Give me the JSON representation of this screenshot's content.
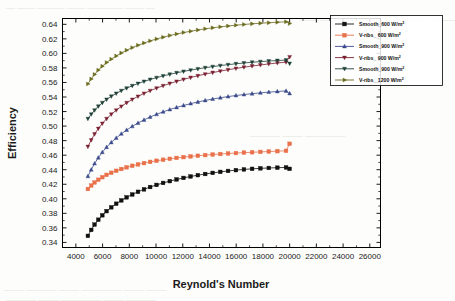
{
  "figure": {
    "background_color": "#fdfdfb",
    "plot_area_border_color": "#000000"
  },
  "ghost_text": [
    {
      "text": "—  ——  ———   ——  ————  ——  —",
      "x": 6,
      "y": 2,
      "size": 9
    },
    {
      "text": "——  ———  ——  ———— —— ———",
      "x": 300,
      "y": 14,
      "size": 9
    },
    {
      "text": "———  ——  ————",
      "x": 250,
      "y": 130,
      "size": 10
    },
    {
      "text": "—— ——— ——  ———— —— ——",
      "x": 4,
      "y": 284,
      "size": 10
    },
    {
      "text": "———  —— ————  ——  ———",
      "x": 6,
      "y": 294,
      "size": 10
    }
  ],
  "chart_data": {
    "type": "line",
    "title": "",
    "xlabel": "Reynold's Number",
    "ylabel": "Efficiency",
    "xlim": [
      3000,
      26800
    ],
    "ylim": [
      0.333,
      0.648
    ],
    "xticks": [
      4000,
      6000,
      8000,
      10000,
      12000,
      14000,
      16000,
      18000,
      20000,
      22000,
      24000,
      26000
    ],
    "xtick_labels": [
      "4000",
      "6000",
      "8000",
      "10000",
      "12000",
      "14000",
      "16000",
      "18000",
      "20000",
      "22000",
      "24000",
      "26000"
    ],
    "yticks": [
      0.34,
      0.36,
      0.38,
      0.4,
      0.42,
      0.44,
      0.46,
      0.48,
      0.5,
      0.52,
      0.54,
      0.56,
      0.58,
      0.6,
      0.62,
      0.64
    ],
    "ytick_labels": [
      "0.34",
      "0.36",
      "0.38",
      "0.40",
      "0.42",
      "0.44",
      "0.46",
      "0.48",
      "0.50",
      "0.52",
      "0.54",
      "0.56",
      "0.58",
      "0.60",
      "0.62",
      "0.64"
    ],
    "grid": false,
    "legend_position": "upper right",
    "x": [
      4900,
      5150,
      5400,
      5680,
      5980,
      6300,
      6650,
      7020,
      7400,
      7800,
      8220,
      8650,
      9100,
      9560,
      10040,
      10530,
      11030,
      11540,
      12060,
      12590,
      13130,
      13680,
      14240,
      14810,
      15390,
      15980,
      16580,
      17190,
      17810,
      18440,
      19080,
      19730,
      20000
    ],
    "series": [
      {
        "name": "Smooth_600 W/m²",
        "label_main": "Smooth_600 W/m",
        "label_sup": "2",
        "color": "#111111",
        "marker": "square",
        "values": [
          0.349,
          0.3572,
          0.3645,
          0.3712,
          0.3773,
          0.383,
          0.3883,
          0.3932,
          0.3978,
          0.402,
          0.4059,
          0.4096,
          0.413,
          0.4162,
          0.4191,
          0.4218,
          0.4243,
          0.4266,
          0.4287,
          0.4307,
          0.4325,
          0.4341,
          0.4356,
          0.437,
          0.4383,
          0.4394,
          0.4404,
          0.4412,
          0.4419,
          0.4424,
          0.4428,
          0.4431,
          0.4412
        ]
      },
      {
        "name": "V-ribs_ 600 W/m²",
        "label_main": "V-ribs_ 600 W/m",
        "label_sup": "2",
        "color": "#e8714a",
        "marker": "square",
        "values": [
          0.4135,
          0.4182,
          0.4224,
          0.4262,
          0.4297,
          0.4329,
          0.4358,
          0.4385,
          0.441,
          0.4433,
          0.4454,
          0.4473,
          0.4491,
          0.4508,
          0.4523,
          0.4537,
          0.455,
          0.4562,
          0.4573,
          0.4583,
          0.4592,
          0.4601,
          0.4609,
          0.4616,
          0.4623,
          0.4629,
          0.4635,
          0.464,
          0.4645,
          0.465,
          0.4655,
          0.466,
          0.4757
        ]
      },
      {
        "name": "Smooth_900 W/m²",
        "label_main": "Smooth_900 W/m",
        "label_sup": "2",
        "color": "#3b4a8c",
        "marker": "triangle-up",
        "values": [
          0.431,
          0.44,
          0.4485,
          0.4565,
          0.464,
          0.471,
          0.4775,
          0.4836,
          0.4893,
          0.4946,
          0.4996,
          0.5042,
          0.5085,
          0.5125,
          0.5162,
          0.5196,
          0.5228,
          0.5257,
          0.5284,
          0.5309,
          0.5332,
          0.5353,
          0.5372,
          0.539,
          0.5406,
          0.5421,
          0.5434,
          0.5446,
          0.5457,
          0.5467,
          0.5476,
          0.5484,
          0.5449
        ]
      },
      {
        "name": "V-ribs_ 900 W/m²",
        "label_main": "V-ribs_ 900 W/m",
        "label_sup": "2",
        "color": "#7a2030",
        "marker": "triangle-down",
        "values": [
          0.4718,
          0.4808,
          0.489,
          0.4966,
          0.5036,
          0.5101,
          0.5162,
          0.5218,
          0.5271,
          0.532,
          0.5366,
          0.5409,
          0.5449,
          0.5487,
          0.5522,
          0.5555,
          0.5586,
          0.5615,
          0.5642,
          0.5668,
          0.5692,
          0.5715,
          0.5736,
          0.5756,
          0.5775,
          0.5793,
          0.581,
          0.5826,
          0.5841,
          0.5855,
          0.5868,
          0.588,
          0.5952
        ]
      },
      {
        "name": "Smooth_900 W/m²",
        "label_main": "Smooth_900 W/m",
        "label_sup": "2",
        "color": "#1f4038",
        "marker": "triangle-down",
        "values": [
          0.5102,
          0.5163,
          0.5219,
          0.5272,
          0.5321,
          0.5367,
          0.541,
          0.545,
          0.5487,
          0.5522,
          0.5555,
          0.5586,
          0.5614,
          0.5641,
          0.5666,
          0.569,
          0.5712,
          0.5733,
          0.5752,
          0.577,
          0.5787,
          0.5803,
          0.5818,
          0.5832,
          0.5845,
          0.5857,
          0.5868,
          0.5878,
          0.5887,
          0.5895,
          0.5902,
          0.5908,
          0.5861
        ]
      },
      {
        "name": "V-ribs_ 1200 W/m²",
        "label_main": "V-ribs_ 1200 W/m",
        "label_sup": "2",
        "color": "#6b6b1f",
        "marker": "triangle-right",
        "values": [
          0.558,
          0.5648,
          0.5711,
          0.577,
          0.5824,
          0.5874,
          0.5921,
          0.5965,
          0.6006,
          0.6044,
          0.6079,
          0.6112,
          0.6143,
          0.6172,
          0.6198,
          0.6223,
          0.6246,
          0.6267,
          0.6287,
          0.6305,
          0.6322,
          0.6338,
          0.6352,
          0.6365,
          0.6377,
          0.6388,
          0.6398,
          0.6407,
          0.6415,
          0.6422,
          0.6429,
          0.6435,
          0.6412
        ]
      }
    ]
  }
}
